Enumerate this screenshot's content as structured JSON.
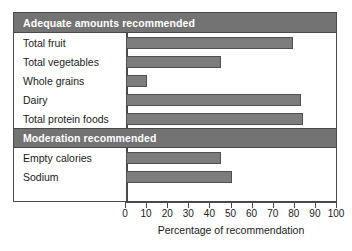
{
  "chart_data": {
    "type": "bar",
    "orientation": "horizontal",
    "title": "",
    "xlabel": "Percentage of recommendation",
    "ylabel": "",
    "xlim": [
      0,
      100
    ],
    "xticks": [
      0,
      10,
      20,
      30,
      40,
      50,
      60,
      70,
      80,
      90,
      100
    ],
    "grid": false,
    "legend": null,
    "groups": [
      {
        "label": "Adequate amounts recommended",
        "categories": [
          "Total fruit",
          "Total vegetables",
          "Whole grains",
          "Dairy",
          "Total protein foods"
        ],
        "values": [
          79,
          45,
          10,
          83,
          84
        ]
      },
      {
        "label": "Moderation recommended",
        "categories": [
          "Empty calories",
          "Sodium"
        ],
        "values": [
          45,
          50
        ]
      }
    ],
    "categories": [
      "Total fruit",
      "Total vegetables",
      "Whole grains",
      "Dairy",
      "Total protein foods",
      "Empty calories",
      "Sodium"
    ],
    "values": [
      79,
      45,
      10,
      83,
      84,
      45,
      50
    ],
    "colors": {
      "bar_fill": "#7d7d7d",
      "bar_border": "#4f4f4f",
      "header_band": "#737373",
      "header_text": "#ffffff",
      "frame": "#4a4a4a",
      "background": "#ffffff",
      "text": "#1a1a1a"
    }
  }
}
